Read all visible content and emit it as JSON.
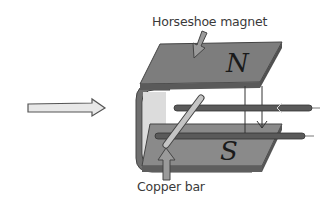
{
  "labels": {
    "magnet": "Horseshoe magnet",
    "bar": "Copper bar",
    "north_pole": "N",
    "south_pole": "S"
  },
  "colors": {
    "magnet_face": "#7a7a7a",
    "magnet_edge": "#4a4a4a",
    "magnet_inner": "#d9d9d9",
    "rail": "#5a5a5a",
    "copper_bar": "#bdbdbd",
    "label_text": "#3a3a3a"
  },
  "annotations": [
    {
      "id": "magnet-pointer",
      "target": "Horseshoe magnet"
    },
    {
      "id": "bar-pointer",
      "target": "Copper bar"
    },
    {
      "id": "motion-arrow",
      "direction": "right"
    }
  ]
}
